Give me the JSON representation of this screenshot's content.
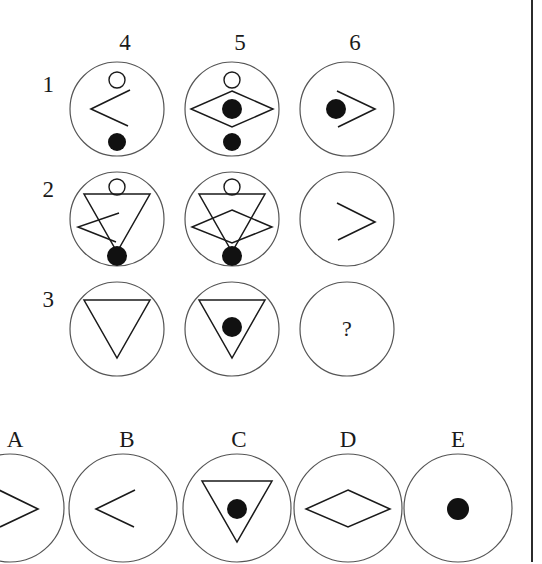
{
  "puzzle": {
    "type": "raven-progressive-matrix",
    "column_headers": [
      "4",
      "5",
      "6"
    ],
    "row_labels": [
      "1",
      "2",
      "3"
    ],
    "missing_cell_marker": "?",
    "ink_color": "#1a1a1a",
    "background_color": "#ffffff",
    "border_color": "#2b2b2b",
    "matrix_cells": [
      {
        "row": "1",
        "column": "4",
        "elements": [
          "small-hollow-circle-top",
          "left-chevron",
          "filled-dot-bottom"
        ]
      },
      {
        "row": "1",
        "column": "5",
        "elements": [
          "small-hollow-circle-top",
          "diamond",
          "filled-dot-center",
          "filled-dot-bottom"
        ]
      },
      {
        "row": "1",
        "column": "6",
        "elements": [
          "right-chevron",
          "filled-dot-center"
        ]
      },
      {
        "row": "2",
        "column": "4",
        "elements": [
          "small-hollow-circle-top",
          "down-triangle",
          "left-chevron",
          "filled-dot-bottom"
        ]
      },
      {
        "row": "2",
        "column": "5",
        "elements": [
          "small-hollow-circle-top",
          "down-triangle",
          "diamond",
          "filled-dot-bottom"
        ]
      },
      {
        "row": "2",
        "column": "6",
        "elements": [
          "right-chevron"
        ]
      },
      {
        "row": "3",
        "column": "4",
        "elements": [
          "down-triangle"
        ]
      },
      {
        "row": "3",
        "column": "5",
        "elements": [
          "down-triangle",
          "filled-dot-center"
        ]
      },
      {
        "row": "3",
        "column": "6",
        "elements": [
          "question-mark"
        ]
      }
    ],
    "options": [
      {
        "label": "A",
        "elements": [
          "right-chevron"
        ]
      },
      {
        "label": "B",
        "elements": [
          "left-chevron"
        ]
      },
      {
        "label": "C",
        "elements": [
          "down-triangle",
          "filled-dot-center"
        ]
      },
      {
        "label": "D",
        "elements": [
          "diamond"
        ]
      },
      {
        "label": "E",
        "elements": [
          "filled-dot-center"
        ]
      }
    ]
  }
}
